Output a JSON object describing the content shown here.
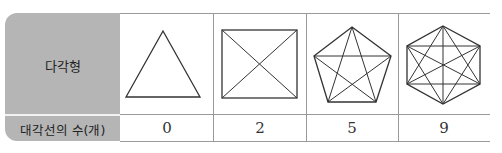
{
  "table": {
    "row_headers": {
      "polygon": "다각형",
      "diagonal_count": "대각선의 수(개)"
    },
    "columns": [
      {
        "shape": "triangle",
        "sides": 3,
        "diagonals": "0"
      },
      {
        "shape": "square",
        "sides": 4,
        "diagonals": "2"
      },
      {
        "shape": "pentagon",
        "sides": 5,
        "diagonals": "5"
      },
      {
        "shape": "hexagon",
        "sides": 6,
        "diagonals": "9"
      }
    ]
  },
  "colors": {
    "header_bg": "#b5b5b5",
    "border": "#9a9a9a",
    "stroke": "#333333"
  }
}
